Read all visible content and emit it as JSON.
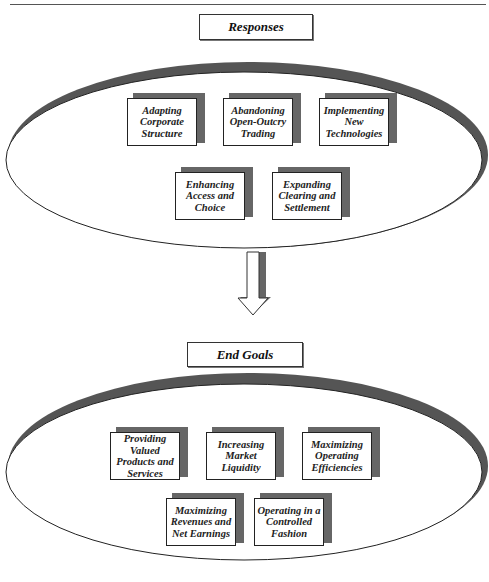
{
  "responses": {
    "title": "Responses",
    "items": [
      {
        "label": "Adapting Corporate Structure"
      },
      {
        "label": "Abandoning Open-Outcry Trading"
      },
      {
        "label": "Implementing New Technologies"
      },
      {
        "label": "Enhancing Access and Choice"
      },
      {
        "label": "Expanding Clearing and Settlement"
      }
    ]
  },
  "end_goals": {
    "title": "End Goals",
    "items": [
      {
        "label": "Providing Valued Products and Services"
      },
      {
        "label": "Increasing Market Liquidity"
      },
      {
        "label": "Maximizing Operating Efficiencies"
      },
      {
        "label": "Maximizing Revenues and Net Earnings"
      },
      {
        "label": "Operating in a Controlled Fashion"
      }
    ]
  },
  "connector": {
    "icon": "down-arrow-icon"
  }
}
